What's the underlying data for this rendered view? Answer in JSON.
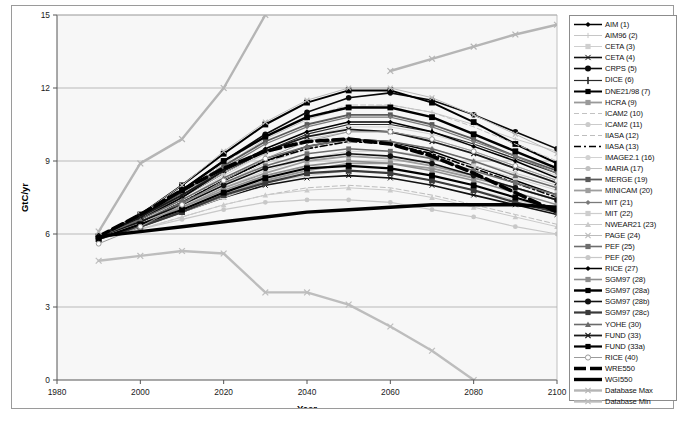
{
  "figure": {
    "caption": ""
  },
  "axes": {
    "xlabel": "Year",
    "ylabel": "GtC/yr",
    "xticks": [
      "1980",
      "2000",
      "2020",
      "2040",
      "2060",
      "2080",
      "2100"
    ],
    "yticks": [
      "0",
      "3",
      "6",
      "9",
      "12",
      "15"
    ]
  },
  "colors": {
    "black": "#000000",
    "dark_gray": "#444444",
    "mid_gray": "#8a8a8a",
    "light_gray": "#b8b8b8",
    "pale_gray": "#cfcfcf",
    "plot_bg": "#f7f7f7",
    "grid": "#a9a9a9",
    "frame": "#9a9a9a"
  },
  "chart_data": {
    "type": "line",
    "title": "",
    "xlabel": "Year",
    "ylabel": "GtC/yr",
    "xlim": [
      1980,
      2100
    ],
    "ylim": [
      0,
      15
    ],
    "xticks": [
      1980,
      2000,
      2020,
      2040,
      2060,
      2080,
      2100
    ],
    "yticks": [
      0,
      3,
      6,
      9,
      12,
      15
    ],
    "grid": true,
    "legend_position": "right-outside",
    "x": [
      1990,
      2000,
      2010,
      2020,
      2030,
      2040,
      2050,
      2060,
      2070,
      2080,
      2090,
      2100
    ],
    "series": [
      {
        "name": "AIM (1)",
        "marker": "diamond",
        "color": "#000000",
        "width": 1.5,
        "dash": "solid",
        "values": [
          5.9,
          6.5,
          7.3,
          8.2,
          9.0,
          9.6,
          9.9,
          9.8,
          9.4,
          8.8,
          8.2,
          7.6
        ]
      },
      {
        "name": "AIM96 (2)",
        "marker": "plus",
        "color": "#c6c6c6",
        "width": 1.0,
        "dash": "solid",
        "values": [
          5.9,
          6.6,
          7.6,
          8.8,
          9.9,
          10.7,
          11.2,
          11.3,
          11.0,
          10.5,
          9.9,
          9.4
        ]
      },
      {
        "name": "CETA (3)",
        "marker": "square",
        "color": "#cfcfcf",
        "width": 1.0,
        "dash": "solid",
        "values": [
          5.8,
          6.4,
          7.1,
          7.9,
          8.6,
          9.1,
          9.4,
          9.4,
          9.2,
          8.8,
          8.3,
          7.8
        ]
      },
      {
        "name": "CETA (4)",
        "marker": "asterisk",
        "color": "#111111",
        "width": 1.6,
        "dash": "solid",
        "values": [
          5.8,
          6.3,
          6.9,
          7.5,
          8.0,
          8.3,
          8.4,
          8.3,
          8.0,
          7.6,
          7.2,
          6.8
        ]
      },
      {
        "name": "CRPS (5)",
        "marker": "hexagon",
        "color": "#0a0a0a",
        "width": 1.6,
        "dash": "solid",
        "values": [
          5.9,
          6.7,
          7.8,
          9.0,
          10.1,
          11.0,
          11.6,
          11.8,
          11.5,
          10.9,
          10.2,
          9.5
        ]
      },
      {
        "name": "DICE (6)",
        "marker": "bar",
        "color": "#2a2a2a",
        "width": 1.2,
        "dash": "solid",
        "values": [
          5.9,
          6.6,
          7.5,
          8.5,
          9.4,
          10.1,
          10.5,
          10.5,
          10.2,
          9.7,
          9.1,
          8.5
        ]
      },
      {
        "name": "DNE21/98 (7)",
        "marker": "square",
        "color": "#000000",
        "width": 2.0,
        "dash": "solid",
        "values": [
          5.9,
          6.8,
          8.0,
          9.3,
          10.5,
          11.4,
          11.9,
          11.9,
          11.4,
          10.6,
          9.7,
          8.9
        ]
      },
      {
        "name": "HCRA (9)",
        "marker": "square",
        "color": "#9a9a9a",
        "width": 1.8,
        "dash": "solid",
        "values": [
          5.8,
          6.3,
          6.9,
          7.6,
          8.2,
          8.6,
          8.9,
          8.9,
          8.7,
          8.3,
          7.9,
          7.4
        ]
      },
      {
        "name": "ICAM2 (10)",
        "marker": "none",
        "color": "#c2c2c2",
        "width": 1.0,
        "dash": "dash",
        "values": [
          5.9,
          6.7,
          7.7,
          8.9,
          10.0,
          10.8,
          11.3,
          11.3,
          11.0,
          10.4,
          9.7,
          9.0
        ]
      },
      {
        "name": "ICAM2 (11)",
        "marker": "circle",
        "color": "#cbcbcb",
        "width": 1.0,
        "dash": "solid",
        "values": [
          5.8,
          6.4,
          7.2,
          8.1,
          8.9,
          9.5,
          9.8,
          9.8,
          9.5,
          9.0,
          8.5,
          8.0
        ]
      },
      {
        "name": "IIASA (12)",
        "marker": "none",
        "color": "#bdbdbd",
        "width": 1.0,
        "dash": "dash",
        "values": [
          5.8,
          6.2,
          6.7,
          7.2,
          7.6,
          7.9,
          8.0,
          7.9,
          7.6,
          7.2,
          6.8,
          6.4
        ]
      },
      {
        "name": "IIASA (13)",
        "marker": "none",
        "color": "#000000",
        "width": 1.6,
        "dash": "dashdot",
        "values": [
          5.9,
          6.5,
          7.3,
          8.2,
          9.0,
          9.5,
          9.8,
          9.7,
          9.3,
          8.7,
          8.1,
          7.5
        ]
      },
      {
        "name": "IMAGE2.1 (16)",
        "marker": "circle",
        "color": "#d2d2d2",
        "width": 1.0,
        "dash": "solid",
        "values": [
          5.8,
          6.5,
          7.4,
          8.4,
          9.3,
          10.0,
          10.4,
          10.4,
          10.1,
          9.6,
          9.0,
          8.4
        ]
      },
      {
        "name": "MARIA (17)",
        "marker": "circle",
        "color": "#c0c0c0",
        "width": 1.0,
        "dash": "solid",
        "values": [
          5.9,
          6.6,
          7.5,
          8.5,
          9.3,
          9.9,
          10.2,
          10.2,
          9.9,
          9.4,
          8.8,
          8.2
        ]
      },
      {
        "name": "MERGE (19)",
        "marker": "square",
        "color": "#5a5a5a",
        "width": 1.8,
        "dash": "solid",
        "values": [
          5.9,
          6.7,
          7.7,
          8.8,
          9.8,
          10.5,
          10.9,
          10.9,
          10.5,
          9.9,
          9.2,
          8.6
        ]
      },
      {
        "name": "MINICAM (20)",
        "marker": "square",
        "color": "#9e9e9e",
        "width": 1.8,
        "dash": "solid",
        "values": [
          5.8,
          6.4,
          7.1,
          7.9,
          8.5,
          9.0,
          9.2,
          9.1,
          8.8,
          8.4,
          7.9,
          7.4
        ]
      },
      {
        "name": "MIT (21)",
        "marker": "diamond",
        "color": "#7a7a7a",
        "width": 1.3,
        "dash": "solid",
        "values": [
          5.9,
          6.6,
          7.6,
          8.7,
          9.7,
          10.4,
          10.8,
          10.8,
          10.4,
          9.8,
          9.2,
          8.5
        ]
      },
      {
        "name": "MIT (22)",
        "marker": "square",
        "color": "#cdcdcd",
        "width": 1.2,
        "dash": "solid",
        "values": [
          5.8,
          6.3,
          6.9,
          7.5,
          8.1,
          8.4,
          8.6,
          8.5,
          8.2,
          7.8,
          7.4,
          7.0
        ]
      },
      {
        "name": "NWEAR21 (23)",
        "marker": "triangle",
        "color": "#cacaca",
        "width": 1.0,
        "dash": "solid",
        "values": [
          5.8,
          6.2,
          6.7,
          7.2,
          7.6,
          7.8,
          7.9,
          7.8,
          7.5,
          7.1,
          6.7,
          6.3
        ]
      },
      {
        "name": "PAGE (24)",
        "marker": "bowtie",
        "color": "#bcbcbc",
        "width": 1.0,
        "dash": "solid",
        "values": [
          5.9,
          6.8,
          8.0,
          9.4,
          10.6,
          11.5,
          12.0,
          12.0,
          11.6,
          10.9,
          10.1,
          9.3
        ]
      },
      {
        "name": "PEF (25)",
        "marker": "square",
        "color": "#6e6e6e",
        "width": 1.6,
        "dash": "solid",
        "values": [
          5.9,
          6.5,
          7.3,
          8.1,
          8.8,
          9.3,
          9.5,
          9.4,
          9.1,
          8.6,
          8.1,
          7.6
        ]
      },
      {
        "name": "PEF (26)",
        "marker": "circle",
        "color": "#c8c8c8",
        "width": 1.2,
        "dash": "solid",
        "values": [
          5.8,
          6.2,
          6.6,
          7.0,
          7.3,
          7.4,
          7.4,
          7.3,
          7.0,
          6.7,
          6.3,
          6.0
        ]
      },
      {
        "name": "RICE (27)",
        "marker": "diamond",
        "color": "#000000",
        "width": 1.5,
        "dash": "solid",
        "values": [
          5.9,
          6.6,
          7.5,
          8.6,
          9.5,
          10.2,
          10.6,
          10.6,
          10.2,
          9.6,
          9.0,
          8.3
        ]
      },
      {
        "name": "SGM97 (28)",
        "marker": "square",
        "color": "#8e8e8e",
        "width": 1.6,
        "dash": "solid",
        "values": [
          5.8,
          6.4,
          7.1,
          7.8,
          8.4,
          8.8,
          9.0,
          8.9,
          8.6,
          8.2,
          7.7,
          7.2
        ]
      },
      {
        "name": "SGM97 (28a)",
        "marker": "square",
        "color": "#000000",
        "width": 2.4,
        "dash": "solid",
        "values": [
          5.9,
          6.7,
          7.8,
          9.0,
          10.0,
          10.8,
          11.2,
          11.2,
          10.8,
          10.1,
          9.4,
          8.7
        ]
      },
      {
        "name": "SGM97 (28b)",
        "marker": "hexagon",
        "color": "#111111",
        "width": 1.6,
        "dash": "solid",
        "values": [
          5.9,
          6.5,
          7.2,
          8.0,
          8.7,
          9.1,
          9.3,
          9.2,
          8.9,
          8.4,
          7.9,
          7.4
        ]
      },
      {
        "name": "SGM97 (28c)",
        "marker": "square",
        "color": "#3a3a3a",
        "width": 2.2,
        "dash": "solid",
        "values": [
          5.8,
          6.3,
          6.9,
          7.6,
          8.1,
          8.5,
          8.6,
          8.5,
          8.2,
          7.8,
          7.3,
          6.9
        ]
      },
      {
        "name": "YOHE (30)",
        "marker": "triangle",
        "color": "#6a6a6a",
        "width": 1.6,
        "dash": "solid",
        "values": [
          5.9,
          6.6,
          7.4,
          8.3,
          9.1,
          9.6,
          9.9,
          9.8,
          9.5,
          9.0,
          8.4,
          7.9
        ]
      },
      {
        "name": "FUND (33)",
        "marker": "bowtie",
        "color": "#1a1a1a",
        "width": 1.8,
        "dash": "solid",
        "values": [
          5.9,
          6.7,
          7.6,
          8.6,
          9.4,
          10.0,
          10.3,
          10.2,
          9.8,
          9.3,
          8.7,
          8.1
        ]
      },
      {
        "name": "FUND (33a)",
        "marker": "square",
        "color": "#000000",
        "width": 2.2,
        "dash": "solid",
        "values": [
          5.8,
          6.4,
          7.0,
          7.7,
          8.3,
          8.7,
          8.8,
          8.7,
          8.4,
          8.0,
          7.5,
          7.0
        ]
      },
      {
        "name": "RICE (40)",
        "marker": "circle-open",
        "color": "#9b9b9b",
        "width": 1.0,
        "dash": "solid",
        "values": [
          5.6,
          6.3,
          7.2,
          8.2,
          9.1,
          9.8,
          10.2,
          10.2,
          9.9,
          9.4,
          8.8,
          8.2
        ]
      },
      {
        "name": "WRE550",
        "marker": "none",
        "color": "#000000",
        "width": 3.6,
        "dash": "heavy-dash",
        "values": [
          5.9,
          6.8,
          7.8,
          8.7,
          9.4,
          9.8,
          9.9,
          9.7,
          9.2,
          8.5,
          7.7,
          6.9
        ]
      },
      {
        "name": "WGI550",
        "marker": "none",
        "color": "#000000",
        "width": 3.4,
        "dash": "solid",
        "values": [
          5.9,
          6.1,
          6.3,
          6.5,
          6.7,
          6.9,
          7.0,
          7.1,
          7.2,
          7.2,
          7.2,
          7.1
        ]
      },
      {
        "name": "Database Max",
        "marker": "bowtie",
        "color": "#b5b5b5",
        "width": 2.4,
        "dash": "solid",
        "values": [
          6.1,
          8.9,
          9.9,
          12.0,
          15.0,
          null,
          null,
          null,
          null,
          null,
          null,
          null
        ]
      },
      {
        "name": "Database Min",
        "marker": "bowtie",
        "color": "#bdbdbd",
        "width": 2.4,
        "dash": "solid",
        "values": [
          4.9,
          5.1,
          5.3,
          5.2,
          3.6,
          3.6,
          3.1,
          2.2,
          1.2,
          0.0,
          null,
          null
        ]
      }
    ],
    "database_max_extra": {
      "note": "rises off-scale above 15 GtC/yr after ~2030, re-enters at right",
      "tail_x": [
        2060,
        2070,
        2080,
        2090,
        2100
      ],
      "tail_y": [
        12.7,
        13.2,
        13.7,
        14.2,
        14.6
      ]
    }
  },
  "legend": {
    "items": [
      {
        "label": "AIM (1)"
      },
      {
        "label": "AIM96 (2)"
      },
      {
        "label": "CETA (3)"
      },
      {
        "label": "CETA (4)"
      },
      {
        "label": "CRPS (5)"
      },
      {
        "label": "DICE (6)"
      },
      {
        "label": "DNE21/98 (7)"
      },
      {
        "label": "HCRA (9)"
      },
      {
        "label": "ICAM2 (10)"
      },
      {
        "label": "ICAM2 (11)"
      },
      {
        "label": "IIASA (12)"
      },
      {
        "label": "IIASA (13)"
      },
      {
        "label": "IMAGE2.1 (16)"
      },
      {
        "label": "MARIA (17)"
      },
      {
        "label": "MERGE (19)"
      },
      {
        "label": "MINICAM (20)"
      },
      {
        "label": "MIT (21)"
      },
      {
        "label": "MIT (22)"
      },
      {
        "label": "NWEAR21 (23)"
      },
      {
        "label": "PAGE (24)"
      },
      {
        "label": "PEF (25)"
      },
      {
        "label": "PEF (26)"
      },
      {
        "label": "RICE (27)"
      },
      {
        "label": "SGM97 (28)"
      },
      {
        "label": "SGM97 (28a)"
      },
      {
        "label": "SGM97 (28b)"
      },
      {
        "label": "SGM97 (28c)"
      },
      {
        "label": "YOHE (30)"
      },
      {
        "label": "FUND (33)"
      },
      {
        "label": "FUND (33a)"
      },
      {
        "label": "RICE (40)"
      },
      {
        "label": "WRE550"
      },
      {
        "label": "WGI550"
      },
      {
        "label": "Database Max"
      },
      {
        "label": "Database Min"
      }
    ]
  }
}
